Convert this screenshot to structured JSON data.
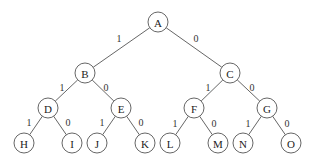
{
  "diagram": {
    "type": "binary-tree",
    "node_radius": 10,
    "nodes": [
      {
        "id": "A",
        "label": "A",
        "x": 158,
        "y": 22
      },
      {
        "id": "B",
        "label": "B",
        "x": 85,
        "y": 73
      },
      {
        "id": "C",
        "label": "C",
        "x": 230,
        "y": 73
      },
      {
        "id": "D",
        "label": "D",
        "x": 48,
        "y": 108
      },
      {
        "id": "E",
        "label": "E",
        "x": 121,
        "y": 108
      },
      {
        "id": "F",
        "label": "F",
        "x": 194,
        "y": 108
      },
      {
        "id": "G",
        "label": "G",
        "x": 267,
        "y": 108
      },
      {
        "id": "H",
        "label": "H",
        "x": 24,
        "y": 143
      },
      {
        "id": "I",
        "label": "I",
        "x": 72,
        "y": 143
      },
      {
        "id": "J",
        "label": "J",
        "x": 97,
        "y": 143
      },
      {
        "id": "K",
        "label": "K",
        "x": 145,
        "y": 143
      },
      {
        "id": "L",
        "label": "L",
        "x": 170,
        "y": 143
      },
      {
        "id": "M",
        "label": "M",
        "x": 218,
        "y": 143
      },
      {
        "id": "N",
        "label": "N",
        "x": 243,
        "y": 143
      },
      {
        "id": "O",
        "label": "O",
        "x": 291,
        "y": 143
      }
    ],
    "edges": [
      {
        "from": "A",
        "to": "B",
        "label": "1",
        "lx": 119,
        "ly": 38
      },
      {
        "from": "A",
        "to": "C",
        "label": "0",
        "lx": 196,
        "ly": 38
      },
      {
        "from": "B",
        "to": "D",
        "label": "1",
        "lx": 62,
        "ly": 87
      },
      {
        "from": "B",
        "to": "E",
        "label": "0",
        "lx": 106,
        "ly": 87
      },
      {
        "from": "C",
        "to": "F",
        "label": "1",
        "lx": 208,
        "ly": 87
      },
      {
        "from": "C",
        "to": "G",
        "label": "0",
        "lx": 252,
        "ly": 87
      },
      {
        "from": "D",
        "to": "H",
        "label": "1",
        "lx": 29,
        "ly": 122
      },
      {
        "from": "D",
        "to": "I",
        "label": "0",
        "lx": 68,
        "ly": 122
      },
      {
        "from": "E",
        "to": "J",
        "label": "1",
        "lx": 102,
        "ly": 122
      },
      {
        "from": "E",
        "to": "K",
        "label": "0",
        "lx": 141,
        "ly": 122
      },
      {
        "from": "F",
        "to": "L",
        "label": "1",
        "lx": 175,
        "ly": 123
      },
      {
        "from": "F",
        "to": "M",
        "label": "0",
        "lx": 214,
        "ly": 123
      },
      {
        "from": "G",
        "to": "N",
        "label": "1",
        "lx": 248,
        "ly": 123
      },
      {
        "from": "G",
        "to": "O",
        "label": "0",
        "lx": 287,
        "ly": 123
      }
    ]
  }
}
